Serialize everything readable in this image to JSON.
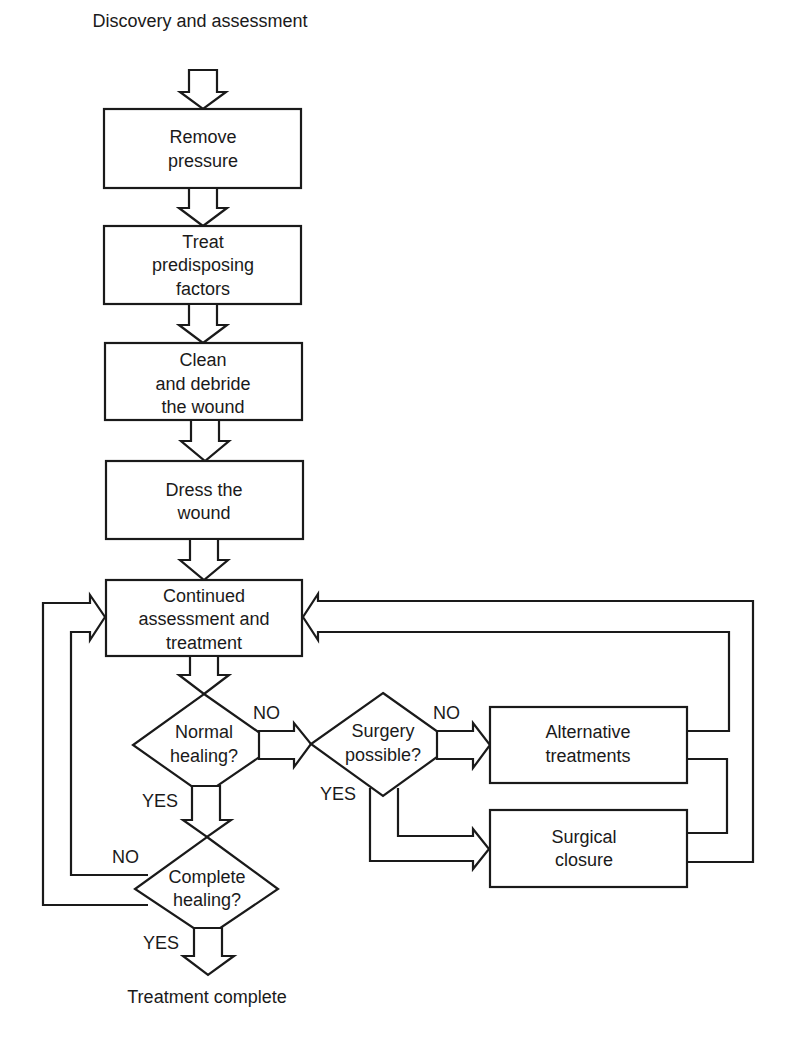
{
  "diagram": {
    "type": "flowchart",
    "start_label": "Discovery and assessment",
    "end_label": "Treatment complete",
    "colors": {
      "line": "#1a1a1a",
      "background": "#ffffff"
    },
    "steps": [
      {
        "id": "remove-pressure",
        "lines": [
          "Remove",
          "pressure"
        ]
      },
      {
        "id": "treat-factors",
        "lines": [
          "Treat",
          "predisposing",
          "factors"
        ]
      },
      {
        "id": "clean-debride",
        "lines": [
          "Clean",
          "and debride",
          "the wound"
        ]
      },
      {
        "id": "dress-wound",
        "lines": [
          "Dress the",
          "wound"
        ]
      },
      {
        "id": "continued-assessment",
        "lines": [
          "Continued",
          "assessment and",
          "treatment"
        ]
      }
    ],
    "decisions": [
      {
        "id": "normal-healing",
        "lines": [
          "Normal",
          "healing?"
        ],
        "yes": "YES",
        "no": "NO"
      },
      {
        "id": "surgery-possible",
        "lines": [
          "Surgery",
          "possible?"
        ],
        "yes": "YES",
        "no": "NO"
      },
      {
        "id": "complete-healing",
        "lines": [
          "Complete",
          "healing?"
        ],
        "yes": "YES",
        "no": "NO"
      }
    ],
    "outcomes": [
      {
        "id": "alternative-treatments",
        "lines": [
          "Alternative",
          "treatments"
        ]
      },
      {
        "id": "surgical-closure",
        "lines": [
          "Surgical",
          "closure"
        ]
      }
    ],
    "edges": [
      {
        "from": "start",
        "to": "remove-pressure"
      },
      {
        "from": "remove-pressure",
        "to": "treat-factors"
      },
      {
        "from": "treat-factors",
        "to": "clean-debride"
      },
      {
        "from": "clean-debride",
        "to": "dress-wound"
      },
      {
        "from": "dress-wound",
        "to": "continued-assessment"
      },
      {
        "from": "continued-assessment",
        "to": "normal-healing"
      },
      {
        "from": "normal-healing",
        "to": "surgery-possible",
        "label": "NO"
      },
      {
        "from": "normal-healing",
        "to": "complete-healing",
        "label": "YES"
      },
      {
        "from": "surgery-possible",
        "to": "alternative-treatments",
        "label": "NO"
      },
      {
        "from": "surgery-possible",
        "to": "surgical-closure",
        "label": "YES"
      },
      {
        "from": "alternative-treatments",
        "to": "continued-assessment"
      },
      {
        "from": "alternative-treatments",
        "to": "surgical-closure"
      },
      {
        "from": "surgical-closure",
        "to": "continued-assessment"
      },
      {
        "from": "complete-healing",
        "to": "continued-assessment",
        "label": "NO"
      },
      {
        "from": "complete-healing",
        "to": "end",
        "label": "YES"
      }
    ]
  }
}
